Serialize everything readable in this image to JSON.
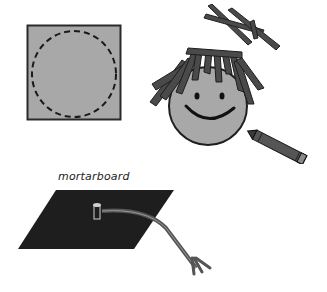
{
  "illustration": {
    "figures": [
      {
        "name": "gray square with dashed circle",
        "kind": "template-square"
      },
      {
        "name": "cut paper strips",
        "kind": "paper-strips"
      },
      {
        "name": "smiling face with paper-strip hair",
        "kind": "face"
      },
      {
        "name": "crayon",
        "kind": "crayon"
      },
      {
        "name": "mortarboard",
        "kind": "graduation-cap"
      }
    ],
    "mortarboard_label": "mortarboard"
  },
  "colors": {
    "gray_fill": "#a8a8a8",
    "dark_strip": "#4a4a4a",
    "outline": "#222222",
    "cap_black": "#1e1e1e",
    "background": "#ffffff"
  }
}
